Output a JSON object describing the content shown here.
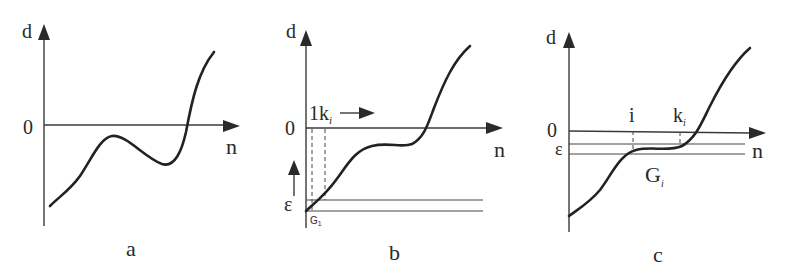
{
  "figure": {
    "panels": [
      {
        "id": "a",
        "caption": "a",
        "y_axis_label": "d",
        "x_axis_label": "n",
        "zero_label": "0",
        "curve_description": "starts negative, rises to local max below zero, dips to local min, then rises steeply crossing zero"
      },
      {
        "id": "b",
        "caption": "b",
        "y_axis_label": "d",
        "x_axis_label": "n",
        "zero_label": "0",
        "index_label": "1k",
        "index_subscript": "i",
        "epsilon_label": "ε",
        "band_label": "G",
        "band_subscript": "1",
        "curve_description": "starts at epsilon band near origin, rises to plateau below zero, then rises crossing zero"
      },
      {
        "id": "c",
        "caption": "c",
        "y_axis_label": "d",
        "x_axis_label": "n",
        "zero_label": "0",
        "epsilon_label": "ε",
        "tick_i_label": "i",
        "tick_k_label": "k",
        "tick_k_subscript": "i",
        "band_label": "G",
        "band_subscript": "i",
        "curve_description": "starts deep negative, rises into epsilon band plateau between i and k_i, then rises crossing zero"
      }
    ]
  }
}
